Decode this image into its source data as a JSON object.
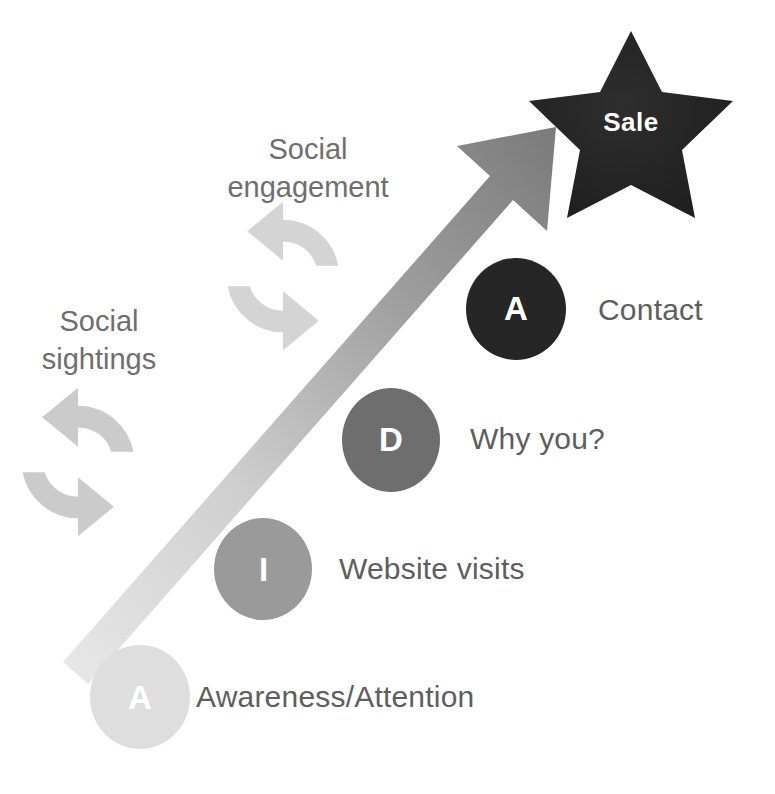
{
  "diagram": {
    "background_color": "#ffffff",
    "goal": {
      "shape": "star",
      "label": "Sale",
      "fill_color": "#262626",
      "text_color": "#ffffff"
    },
    "arrow": {
      "name": "growth-arrow",
      "direction": "up-right",
      "gradient_from": "#e3e3e3",
      "gradient_to": "#7d7d7d"
    },
    "stages": [
      {
        "letter": "A",
        "label": "Contact",
        "circle_color": "#262626",
        "letter_color": "#ffffff"
      },
      {
        "letter": "D",
        "label": "Why you?",
        "circle_color": "#6e6e6e",
        "letter_color": "#ffffff"
      },
      {
        "letter": "I",
        "label": "Website visits",
        "circle_color": "#9a9a9a",
        "letter_color": "#ffffff"
      },
      {
        "letter": "A",
        "label": "Awareness/Attention",
        "circle_color": "#dedede",
        "letter_color": "#ffffff"
      }
    ],
    "cycles": [
      {
        "icon": "refresh-cycle-icon",
        "label": "Social\nengagement",
        "color": "#d2d2d2",
        "text_color": "#6e6e6e"
      },
      {
        "icon": "refresh-cycle-icon",
        "label": "Social\nsightings",
        "color": "#c9c9c9",
        "text_color": "#6e6e6e"
      }
    ]
  }
}
